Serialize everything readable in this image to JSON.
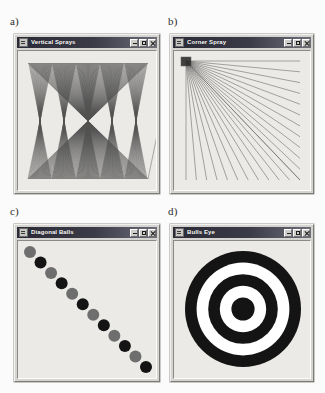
{
  "figure": {
    "background_color": "#fbfbfb",
    "panels": [
      {
        "label": "a)",
        "window": {
          "title": "Vertical Sprays",
          "sysmenu_icon": "system-menu-icon",
          "buttons": [
            {
              "name": "minimize-button",
              "icon": "minimize-icon",
              "label": "_"
            },
            {
              "name": "maximize-button",
              "icon": "maximize-icon",
              "label": "□"
            },
            {
              "name": "close-button",
              "icon": "close-icon",
              "label": "×"
            }
          ]
        },
        "drawing": {
          "type": "vertical-sprays",
          "description": "Zig-zag spray of straight lines between evenly spaced points on the top edge and bottom edge, forming five sharp peaks",
          "peaks": 5,
          "line_color": "#4a4a4a",
          "line_count": 120,
          "background_color": "#eceae6"
        }
      },
      {
        "label": "b)",
        "window": {
          "title": "Corner Spray",
          "sysmenu_icon": "system-menu-icon",
          "buttons": [
            {
              "name": "minimize-button",
              "icon": "minimize-icon",
              "label": "_"
            },
            {
              "name": "maximize-button",
              "icon": "maximize-icon",
              "label": "□"
            },
            {
              "name": "close-button",
              "icon": "close-icon",
              "label": "×"
            }
          ]
        },
        "drawing": {
          "type": "corner-spray",
          "description": "Rays fanning out from the top-left corner to evenly spaced points along the right edge and the bottom edge",
          "origin": "top-left",
          "ray_count": 24,
          "line_color": "#555555",
          "background_color": "#eceae6"
        }
      },
      {
        "label": "c)",
        "window": {
          "title": "Diagonal Balls",
          "sysmenu_icon": "system-menu-icon",
          "buttons": [
            {
              "name": "minimize-button",
              "icon": "minimize-icon",
              "label": "_"
            },
            {
              "name": "maximize-button",
              "icon": "maximize-icon",
              "label": "□"
            },
            {
              "name": "close-button",
              "icon": "close-icon",
              "label": "×"
            }
          ]
        },
        "drawing": {
          "type": "diagonal-balls",
          "description": "Twelve filled circles stepping from the top-left corner to the bottom-right corner, alternating gray and black",
          "ball_count": 12,
          "ball_radius": 6,
          "colors_alternating": [
            "#6e6e6e",
            "#141414"
          ],
          "background_color": "#eceae6"
        }
      },
      {
        "label": "d)",
        "window": {
          "title": "Bulls Eye",
          "sysmenu_icon": "system-menu-icon",
          "buttons": [
            {
              "name": "minimize-button",
              "icon": "minimize-icon",
              "label": "_"
            },
            {
              "name": "maximize-button",
              "icon": "maximize-icon",
              "label": "□"
            },
            {
              "name": "close-button",
              "icon": "close-icon",
              "label": "×"
            }
          ]
        },
        "drawing": {
          "type": "bulls-eye",
          "description": "Concentric target: solid black disc at the centre surrounded by alternating white and black rings",
          "band_count": 5,
          "band_colors": [
            "#141414",
            "#ffffff",
            "#141414",
            "#ffffff",
            "#141414"
          ],
          "outer_radius": 58,
          "background_color": "#eceae6"
        }
      }
    ]
  }
}
